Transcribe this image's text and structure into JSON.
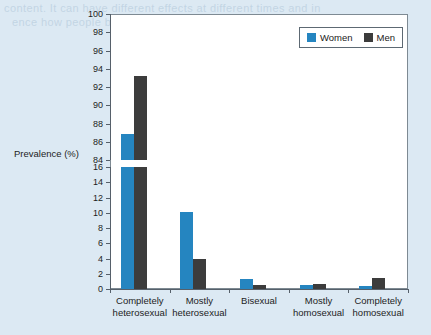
{
  "background": {
    "page_color": "#dce9f3",
    "bleed_text_line1": "content. It can have different effects at different times and in",
    "bleed_text_line2": "ence how people behave in a given situation."
  },
  "axis_label": {
    "y": "Prevalence (%)"
  },
  "legend": {
    "items": [
      {
        "label": "Women",
        "color": "#2585c0"
      },
      {
        "label": "Men",
        "color": "#3c3c3c"
      }
    ]
  },
  "chart_data": {
    "type": "bar",
    "title": "",
    "xlabel": "",
    "ylabel": "Prevalence (%)",
    "grid": false,
    "legend_position": "top-right",
    "broken_axis": true,
    "axis_segments": [
      {
        "name": "upper",
        "ylim": [
          84,
          100
        ],
        "ticks": [
          84,
          86,
          88,
          90,
          92,
          94,
          96,
          98,
          100
        ]
      },
      {
        "name": "lower",
        "ylim": [
          0,
          16
        ],
        "ticks": [
          0,
          2,
          4,
          6,
          8,
          10,
          12,
          14,
          16
        ]
      }
    ],
    "categories": [
      "Completely heterosexual",
      "Mostly heterosexual",
      "Bisexual",
      "Mostly homosexual",
      "Completely homosexual"
    ],
    "category_lines": [
      [
        "Completely",
        "heterosexual"
      ],
      [
        "Mostly",
        "heterosexual"
      ],
      [
        "Bisexual",
        ""
      ],
      [
        "Mostly",
        "homosexual"
      ],
      [
        "Completely",
        "homosexual"
      ]
    ],
    "series": [
      {
        "name": "Women",
        "color": "#2585c0",
        "values": [
          86.8,
          10.1,
          1.3,
          0.5,
          0.4
        ]
      },
      {
        "name": "Men",
        "color": "#3c3c3c",
        "values": [
          93.2,
          3.9,
          0.5,
          0.7,
          1.4
        ]
      }
    ]
  }
}
